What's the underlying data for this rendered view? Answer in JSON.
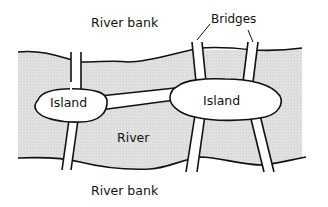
{
  "diagram": {
    "labels": {
      "top_bank": "River bank",
      "bottom_bank": "River bank",
      "river": "River",
      "island_left": "Island",
      "island_right": "Island",
      "bridges": "Bridges"
    },
    "colors": {
      "river_fill": "#dcdcdc",
      "stroke": "#111111",
      "land": "#ffffff"
    },
    "bridge_count": 7
  }
}
